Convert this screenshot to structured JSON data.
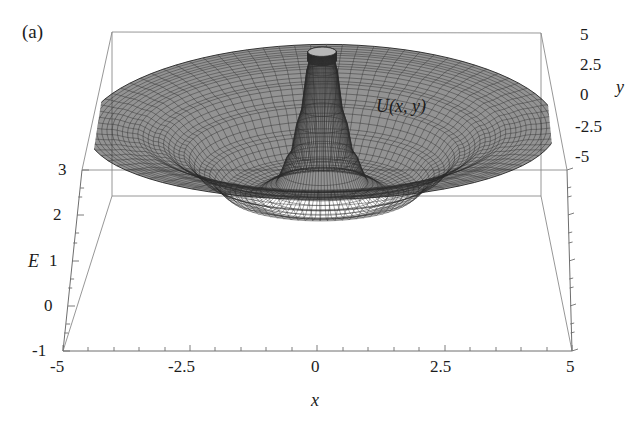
{
  "figure": {
    "panel_label": "(a)",
    "annotation": "U(x, y)",
    "background_color": "#ffffff",
    "mesh_color": "#2b2b2b",
    "frame_color": "#8b8b8b"
  },
  "chart_data": {
    "type": "surface",
    "title": "",
    "panel": "(a)",
    "annotation": "U(x, y)",
    "projection": "3d-wireframe-mesh",
    "xlabel": "x",
    "ylabel": "y",
    "zlabel": "E",
    "xlim": [
      -5,
      5
    ],
    "ylim": [
      -5,
      5
    ],
    "zlim": [
      -1,
      3
    ],
    "xticks": [
      "-5",
      "-2.5",
      "0",
      "2.5",
      "5"
    ],
    "xtick_values": [
      -5,
      -2.5,
      0,
      2.5,
      5
    ],
    "yticks": [
      "5",
      "2.5",
      "0",
      "-2.5",
      "-5"
    ],
    "ytick_values": [
      5,
      2.5,
      0,
      -2.5,
      -5
    ],
    "zticks": [
      "3",
      "2",
      "1",
      "0",
      "-1"
    ],
    "ztick_values": [
      3,
      2,
      1,
      0,
      -1
    ],
    "grid": false,
    "legend": "none",
    "surface": {
      "radial_profile_r": [
        0.0,
        0.25,
        0.45,
        0.7,
        1.0,
        1.5,
        2.0,
        2.5,
        3.0,
        3.5,
        4.0,
        4.5,
        5.0
      ],
      "radial_profile_E": [
        3.9,
        3.9,
        2.6,
        1.6,
        1.0,
        0.75,
        0.85,
        1.25,
        1.7,
        2.0,
        2.2,
        2.3,
        2.35
      ],
      "spike_top_E": 3.9,
      "spike_radius": 0.3,
      "rim_E": 2.35,
      "well_min_E": 0.72
    }
  },
  "axes": {
    "x": {
      "name": "x",
      "ticks": [
        "-5",
        "-2.5",
        "0",
        "2.5",
        "5"
      ]
    },
    "y": {
      "name": "y",
      "ticks": [
        "5",
        "2.5",
        "0",
        "-2.5",
        "-5"
      ]
    },
    "z": {
      "name": "E",
      "ticks": [
        "3",
        "2",
        "1",
        "0",
        "-1"
      ]
    }
  }
}
